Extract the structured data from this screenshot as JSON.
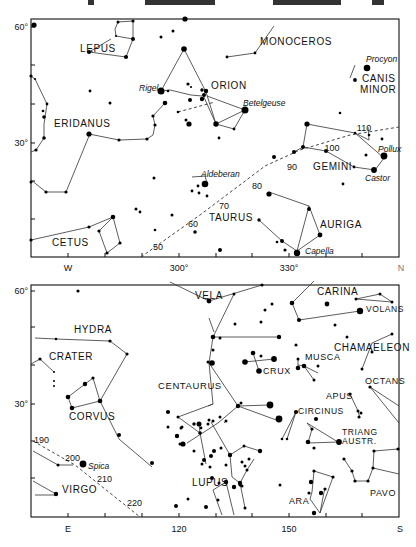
{
  "header_fragments": [
    {
      "x": 88,
      "w": 6
    },
    {
      "x": 145,
      "w": 70
    },
    {
      "x": 273,
      "w": 68
    },
    {
      "x": 372,
      "w": 12
    }
  ],
  "top_chart": {
    "frame": {
      "x": 31,
      "y": 19,
      "w": 368,
      "h": 238
    },
    "dec_labels": [
      {
        "text": "60°",
        "y": 27
      },
      {
        "text": "30°",
        "y": 143
      }
    ],
    "x_labels": [
      {
        "text": "W",
        "x": 68
      },
      {
        "text": "300°",
        "x": 179
      },
      {
        "text": "330°",
        "x": 289
      },
      {
        "text": "N",
        "x": 400
      }
    ],
    "constellations": [
      {
        "name": "LEPUS",
        "x": 80,
        "y": 50
      },
      {
        "name": "ORION",
        "x": 211,
        "y": 87
      },
      {
        "name": "MONOCEROS",
        "x": 260,
        "y": 43
      },
      {
        "name": "CANIS",
        "x": 362,
        "y": 82
      },
      {
        "name": "MINOR",
        "x": 360,
        "y": 89
      },
      {
        "name": "ERIDANUS",
        "x": 54,
        "y": 125
      },
      {
        "name": "GEMINI",
        "x": 313,
        "y": 172
      },
      {
        "name": "TAURUS",
        "x": 209,
        "y": 221
      },
      {
        "name": "AURIGA",
        "x": 320,
        "y": 229
      },
      {
        "name": "CETUS",
        "x": 52,
        "y": 243
      }
    ],
    "star_names": [
      {
        "name": "Rigel",
        "x": 138,
        "y": 88
      },
      {
        "name": "Betelgeuse",
        "x": 243,
        "y": 106
      },
      {
        "name": "Procyon",
        "x": 365,
        "y": 62
      },
      {
        "name": "Pollux",
        "x": 396,
        "y": 149
      },
      {
        "name": "Castor",
        "x": 365,
        "y": 180
      },
      {
        "name": "Aldeberan",
        "x": 200,
        "y": 176
      },
      {
        "name": "Capella",
        "x": 305,
        "y": 252
      }
    ],
    "ecliptic_numbers": [
      "50",
      "60",
      "70",
      "80",
      "90",
      "100",
      "110"
    ]
  },
  "bottom_chart": {
    "frame": {
      "x": 31,
      "y": 285,
      "w": 368,
      "h": 232
    },
    "dec_labels": [
      {
        "text": "60°",
        "y": 291
      },
      {
        "text": "30°",
        "y": 404
      }
    ],
    "x_labels": [
      {
        "text": "E",
        "x": 68
      },
      {
        "text": "120",
        "x": 179
      },
      {
        "text": "150",
        "x": 289
      },
      {
        "text": "S",
        "x": 400
      }
    ],
    "constellations": [
      {
        "name": "VELA",
        "x": 195,
        "y": 295
      },
      {
        "name": "CARINA",
        "x": 317,
        "y": 295
      },
      {
        "name": "VOLANS",
        "x": 366,
        "y": 312
      },
      {
        "name": "HYDRA",
        "x": 74,
        "y": 331
      },
      {
        "name": "CRATER",
        "x": 49,
        "y": 357
      },
      {
        "name": "CHAMAELEON",
        "x": 334,
        "y": 349
      },
      {
        "name": "MUSCA",
        "x": 305,
        "y": 358
      },
      {
        "name": "CRUX",
        "x": 264,
        "y": 373
      },
      {
        "name": "OCTANS",
        "x": 365,
        "y": 382
      },
      {
        "name": "CENTAURUS",
        "x": 158,
        "y": 388
      },
      {
        "name": "APUS",
        "x": 327,
        "y": 398
      },
      {
        "name": "CIRCINUS",
        "x": 297,
        "y": 414
      },
      {
        "name": "CORVUS",
        "x": 69,
        "y": 418
      },
      {
        "name": "TRIANG",
        "x": 342,
        "y": 437
      },
      {
        "name": "AUSTR.",
        "x": 342,
        "y": 444
      },
      {
        "name": "LUPUS",
        "x": 190,
        "y": 485
      },
      {
        "name": "VIRGO",
        "x": 62,
        "y": 493
      },
      {
        "name": "PAVO",
        "x": 370,
        "y": 496
      },
      {
        "name": "ARA",
        "x": 288,
        "y": 503
      }
    ],
    "star_names": [
      {
        "name": "Spica",
        "x": 88,
        "y": 469
      }
    ],
    "ecliptic_numbers": [
      "190",
      "200",
      "210",
      "220"
    ]
  }
}
